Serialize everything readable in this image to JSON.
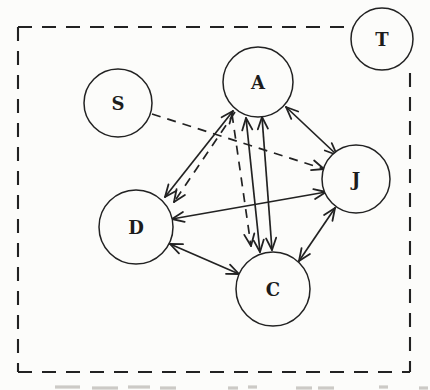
{
  "figure": {
    "type": "sociogram-diagram",
    "background": "#fcfcfa",
    "ink_color": "#222222",
    "faint_mark_color": "#a6a29c",
    "boundary": {
      "style": "dashed",
      "dash_pattern": "14 10",
      "segments": [
        {
          "name": "top",
          "x1": 18,
          "y1": 27,
          "x2": 352,
          "y2": 27
        },
        {
          "name": "left",
          "x1": 18,
          "y1": 27,
          "x2": 18,
          "y2": 372
        },
        {
          "name": "bottom",
          "x1": 18,
          "y1": 372,
          "x2": 410,
          "y2": 372
        },
        {
          "name": "right",
          "x1": 410,
          "y1": 73,
          "x2": 410,
          "y2": 372
        }
      ]
    },
    "nodes": [
      {
        "id": "T",
        "label": "T",
        "cx": 382,
        "cy": 39,
        "r": 31
      },
      {
        "id": "S",
        "label": "S",
        "cx": 118,
        "cy": 103,
        "r": 34
      },
      {
        "id": "A",
        "label": "A",
        "cx": 258,
        "cy": 82,
        "r": 35
      },
      {
        "id": "J",
        "label": "J",
        "cx": 356,
        "cy": 179,
        "r": 34
      },
      {
        "id": "D",
        "label": "D",
        "cx": 136,
        "cy": 227,
        "r": 37
      },
      {
        "id": "C",
        "label": "C",
        "cx": 273,
        "cy": 289,
        "r": 37
      }
    ],
    "edges": [
      {
        "from": "D",
        "to": "A",
        "style": "solid",
        "x1": 165,
        "y1": 197,
        "x2": 233,
        "y2": 111,
        "arrow_start": true,
        "arrow_end": true
      },
      {
        "from": "A",
        "to": "J",
        "style": "solid",
        "x1": 286,
        "y1": 107,
        "x2": 337,
        "y2": 155,
        "arrow_start": true,
        "arrow_end": true
      },
      {
        "from": "A",
        "to": "C",
        "style": "solid",
        "x1": 246,
        "y1": 118,
        "x2": 260,
        "y2": 252,
        "arrow_start": true,
        "arrow_end": true
      },
      {
        "from": "A",
        "to": "C",
        "style": "solid",
        "x1": 262,
        "y1": 117,
        "x2": 272,
        "y2": 250,
        "arrow_start": true,
        "arrow_end": true
      },
      {
        "from": "D",
        "to": "C",
        "style": "solid",
        "x1": 170,
        "y1": 244,
        "x2": 239,
        "y2": 274,
        "arrow_start": true,
        "arrow_end": true
      },
      {
        "from": "C",
        "to": "J",
        "style": "solid",
        "x1": 299,
        "y1": 261,
        "x2": 335,
        "y2": 208,
        "arrow_start": true,
        "arrow_end": true
      },
      {
        "from": "D",
        "to": "J",
        "style": "solid",
        "x1": 172,
        "y1": 219,
        "x2": 326,
        "y2": 192,
        "arrow_start": true,
        "arrow_end": true
      },
      {
        "from": "S",
        "to": "J",
        "style": "dashed",
        "x1": 152,
        "y1": 114,
        "x2": 324,
        "y2": 169,
        "arrow_start": false,
        "arrow_end": true
      },
      {
        "from": "A",
        "to": "D",
        "style": "dashed",
        "x1": 235,
        "y1": 112,
        "x2": 174,
        "y2": 202,
        "arrow_start": false,
        "arrow_end": true
      },
      {
        "from": "A",
        "to": "C",
        "style": "dashed",
        "x1": 232,
        "y1": 114,
        "x2": 251,
        "y2": 246,
        "arrow_start": false,
        "arrow_end": true
      }
    ],
    "caption_fragments": [
      {
        "x1": 55,
        "x2": 80,
        "y": 387
      },
      {
        "x1": 92,
        "x2": 118,
        "y": 388
      },
      {
        "x1": 128,
        "x2": 150,
        "y": 387
      },
      {
        "x1": 160,
        "x2": 176,
        "y": 388
      },
      {
        "x1": 228,
        "x2": 238,
        "y": 388
      },
      {
        "x1": 248,
        "x2": 257,
        "y": 387
      },
      {
        "x1": 296,
        "x2": 312,
        "y": 388
      },
      {
        "x1": 318,
        "x2": 334,
        "y": 388
      },
      {
        "x1": 379,
        "x2": 388,
        "y": 387
      },
      {
        "x1": 419,
        "x2": 428,
        "y": 388
      }
    ],
    "style_hints": {
      "edge_dash_pattern": "9 7",
      "arrowhead": "open-barb",
      "arrow_barb_length": 13
    }
  }
}
